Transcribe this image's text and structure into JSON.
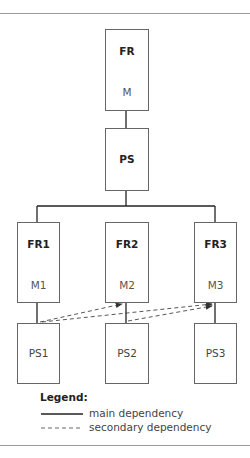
{
  "diagram": {
    "nodes": {
      "fr": {
        "title": "FR",
        "sub": "M"
      },
      "ps": {
        "title": "PS",
        "sub": ""
      },
      "fr1": {
        "title": "FR1",
        "sub": "M1"
      },
      "fr2": {
        "title": "FR2",
        "sub": "M2"
      },
      "fr3": {
        "title": "FR3",
        "sub": "M3"
      },
      "ps1": {
        "title": "PS1"
      },
      "ps2": {
        "title": "PS2"
      },
      "ps3": {
        "title": "PS3"
      }
    },
    "edges": {
      "main": [
        [
          "FR",
          "PS"
        ],
        [
          "PS",
          "FR1"
        ],
        [
          "PS",
          "FR2"
        ],
        [
          "PS",
          "FR3"
        ],
        [
          "FR1",
          "PS1"
        ],
        [
          "FR2",
          "PS2"
        ],
        [
          "FR3",
          "PS3"
        ]
      ],
      "secondary": [
        [
          "PS1",
          "FR2"
        ],
        [
          "PS1",
          "FR3"
        ],
        [
          "PS2",
          "FR3"
        ]
      ]
    }
  },
  "legend": {
    "title": "Legend:",
    "main": "main dependency",
    "secondary": "secondary dependency"
  },
  "colors": {
    "line": "#222222",
    "box_border": "#666666",
    "rule": "#9a9a9a"
  }
}
